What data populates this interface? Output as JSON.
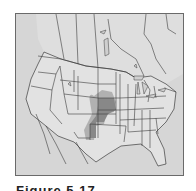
{
  "figure": {
    "caption": "Figure 5.17",
    "map": {
      "region": "North America (USA, southern Canada, northern Mexico)",
      "colors": {
        "background": "#d9d9d9",
        "land_light": "#e4e4e4",
        "water": "#cfcfcf",
        "border": "#3c3c3c",
        "range_shading": "#8a8a8a",
        "range_shadow": "#a8a8a8"
      },
      "highlighted_range": "Central Great Plains (Nebraska, Kansas, eastern Colorado, Oklahoma panhandle, eastern New Mexico, northwest Texas)"
    }
  }
}
